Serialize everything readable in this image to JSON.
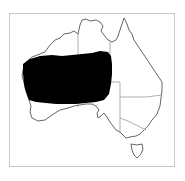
{
  "map": {
    "title": "Distribution map",
    "region": "Australia",
    "colors": {
      "background": "#ffffff",
      "frame": "#c8c8c8",
      "coastline": "#555555",
      "state_borders": "#9a9a9a",
      "range_fill": "#000000"
    },
    "layers": [
      {
        "name": "coastline",
        "label": "Australian coastline"
      },
      {
        "name": "state-borders",
        "label": "State and territory borders"
      },
      {
        "name": "distribution-range",
        "label": "Species range (shaded black)"
      }
    ]
  }
}
